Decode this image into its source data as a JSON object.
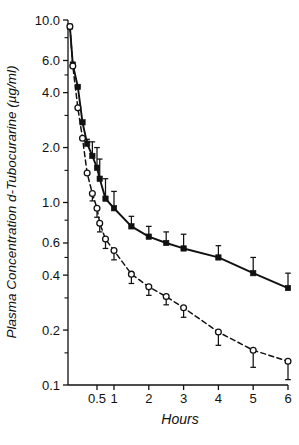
{
  "chart_data": {
    "type": "line",
    "title": "",
    "xlabel": "Hours",
    "ylabel": "Plasma Concentration d-Tubocurarine (µg/ml)",
    "yscale": "log",
    "ylim": [
      0.1,
      10.0
    ],
    "xlim": [
      0,
      6
    ],
    "grid": false,
    "legend": "none",
    "y_ticks_labeled": [
      "10.0",
      "6.0",
      "4.0",
      "2.0",
      "1.0",
      "0.6",
      "0.4",
      "0.2",
      "0.1"
    ],
    "y_tick_values": [
      10.0,
      6.0,
      4.0,
      2.0,
      1.0,
      0.6,
      0.4,
      0.2,
      0.1
    ],
    "y_minor_tick_values": [
      8.0,
      5.0,
      3.0,
      1.5,
      0.8,
      0.5,
      0.3,
      0.15
    ],
    "x_ticks_labeled": [
      "0.5",
      "1",
      "2",
      "3",
      "4",
      "5",
      "6"
    ],
    "x_tick_values": [
      0.5,
      1,
      2,
      3,
      4,
      5,
      6
    ],
    "series": [
      {
        "name": "solid-filled-squares",
        "marker": "filled-square",
        "line": "solid",
        "error_bar_direction": "up",
        "x": [
          0.033,
          0.083,
          0.17,
          0.25,
          0.33,
          0.42,
          0.5,
          0.58,
          0.75,
          1.0,
          1.5,
          2.0,
          2.5,
          3.0,
          4.0,
          5.0,
          6.0
        ],
        "y": [
          9.2,
          5.7,
          4.3,
          2.75,
          2.1,
          1.8,
          1.55,
          1.35,
          1.05,
          0.93,
          0.74,
          0.65,
          0.6,
          0.56,
          0.5,
          0.41,
          0.34
        ],
        "yerr": [
          0.0,
          0.0,
          0.0,
          0.0,
          0.12,
          0.35,
          0.45,
          0.38,
          0.3,
          0.22,
          0.1,
          0.09,
          0.09,
          0.11,
          0.08,
          0.09,
          0.07
        ]
      },
      {
        "name": "dashed-open-circles",
        "marker": "open-circle",
        "line": "dashed",
        "error_bar_direction": "down",
        "x": [
          0.033,
          0.083,
          0.17,
          0.25,
          0.33,
          0.42,
          0.5,
          0.58,
          0.75,
          1.0,
          1.5,
          2.0,
          2.5,
          3.0,
          4.0,
          5.0,
          6.0
        ],
        "y": [
          9.2,
          5.6,
          3.3,
          2.25,
          1.45,
          1.12,
          0.93,
          0.77,
          0.63,
          0.545,
          0.405,
          0.345,
          0.305,
          0.265,
          0.195,
          0.155,
          0.135
        ],
        "yerr": [
          0.0,
          0.0,
          0.0,
          0.0,
          0.0,
          0.1,
          0.1,
          0.08,
          0.07,
          0.06,
          0.045,
          0.035,
          0.03,
          0.03,
          0.03,
          0.03,
          0.028
        ]
      }
    ]
  }
}
